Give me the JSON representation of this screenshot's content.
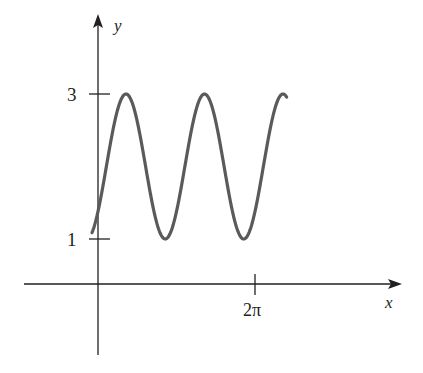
{
  "chart_data": {
    "type": "line",
    "title": "",
    "xlabel": "x",
    "ylabel": "y",
    "function": "y = 2 + sin(2x - φ), amplitude 1, midline y = 2, period π",
    "x_ticks": [
      {
        "value": 6.2832,
        "label": "2π"
      }
    ],
    "y_ticks": [
      {
        "value": 1,
        "label": "1"
      },
      {
        "value": 3,
        "label": "3"
      }
    ],
    "x_range_plotted": [
      -0.24,
      7.55
    ],
    "ylim_visible": [
      -2.3,
      4.4
    ],
    "grid": false,
    "legend": null,
    "series": [
      {
        "name": "curve",
        "color": "#5a5a5a",
        "x": [
          -0.24,
          0.0,
          0.5,
          1.0,
          1.12,
          1.5,
          2.0,
          2.5,
          2.6,
          3.0,
          3.5,
          4.0,
          4.2,
          4.5,
          5.0,
          5.5,
          5.75,
          6.0,
          6.5,
          7.0,
          7.3,
          7.55
        ],
        "y": [
          1.1,
          1.38,
          2.35,
          2.94,
          3.0,
          2.77,
          1.93,
          1.15,
          1.0,
          1.28,
          2.2,
          2.91,
          3.0,
          2.84,
          2.1,
          1.22,
          1.0,
          1.17,
          2.05,
          2.86,
          3.0,
          2.93
        ]
      }
    ],
    "annotations": {
      "peak_value": 3,
      "trough_value": 1
    }
  },
  "labels": {
    "x_axis": "x",
    "y_axis": "y",
    "tick_3": "3",
    "tick_1": "1",
    "tick_2pi": "2π"
  },
  "colors": {
    "axis": "#231f20",
    "curve": "#5a5a5a"
  }
}
